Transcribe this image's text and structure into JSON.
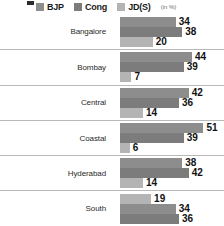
{
  "legend": {
    "unit": "(in %)",
    "items": [
      {
        "label": "BJP",
        "color": "#8d8d8d"
      },
      {
        "label": "Cong",
        "color": "#7c7c7c"
      },
      {
        "label": "JD(S)",
        "color": "#b4b4b4"
      }
    ]
  },
  "chart_data": {
    "type": "bar",
    "orientation": "horizontal",
    "title": "",
    "xlabel": "",
    "ylabel": "",
    "unit": "(in %)",
    "xlim": [
      0,
      55
    ],
    "grid": false,
    "legend_position": "top",
    "categories": [
      "Bangalore",
      "Bombay",
      "Central",
      "Coastal",
      "Hyderabad",
      "South"
    ],
    "series": [
      {
        "name": "BJP",
        "color": "#8d8d8d",
        "values": [
          34,
          44,
          42,
          51,
          38,
          34
        ]
      },
      {
        "name": "Cong",
        "color": "#7c7c7c",
        "values": [
          38,
          39,
          36,
          39,
          42,
          36
        ]
      },
      {
        "name": "JD(S)",
        "color": "#b4b4b4",
        "values": [
          20,
          7,
          14,
          6,
          14,
          19
        ]
      }
    ],
    "groups": [
      {
        "category": "Bangalore",
        "bars": [
          {
            "series": "BJP",
            "value": 34,
            "color": "#8d8d8d"
          },
          {
            "series": "Cong",
            "value": 38,
            "color": "#7c7c7c"
          },
          {
            "series": "JD(S)",
            "value": 20,
            "color": "#b4b4b4"
          }
        ]
      },
      {
        "category": "Bombay",
        "bars": [
          {
            "series": "BJP",
            "value": 44,
            "color": "#8d8d8d"
          },
          {
            "series": "Cong",
            "value": 39,
            "color": "#7c7c7c"
          },
          {
            "series": "JD(S)",
            "value": 7,
            "color": "#b4b4b4"
          }
        ]
      },
      {
        "category": "Central",
        "bars": [
          {
            "series": "BJP",
            "value": 42,
            "color": "#8d8d8d"
          },
          {
            "series": "Cong",
            "value": 36,
            "color": "#7c7c7c"
          },
          {
            "series": "JD(S)",
            "value": 14,
            "color": "#b4b4b4"
          }
        ]
      },
      {
        "category": "Coastal",
        "bars": [
          {
            "series": "BJP",
            "value": 51,
            "color": "#8d8d8d"
          },
          {
            "series": "Cong",
            "value": 39,
            "color": "#7c7c7c"
          },
          {
            "series": "JD(S)",
            "value": 6,
            "color": "#b4b4b4"
          }
        ]
      },
      {
        "category": "Hyderabad",
        "bars": [
          {
            "series": "BJP",
            "value": 38,
            "color": "#8d8d8d"
          },
          {
            "series": "Cong",
            "value": 42,
            "color": "#7c7c7c"
          },
          {
            "series": "JD(S)",
            "value": 14,
            "color": "#b4b4b4"
          }
        ]
      },
      {
        "category": "South",
        "bars": [
          {
            "series": "JD(S)",
            "value": 19,
            "color": "#b4b4b4"
          },
          {
            "series": "BJP",
            "value": 34,
            "color": "#8d8d8d"
          },
          {
            "series": "Cong",
            "value": 36,
            "color": "#7c7c7c"
          }
        ]
      }
    ]
  }
}
